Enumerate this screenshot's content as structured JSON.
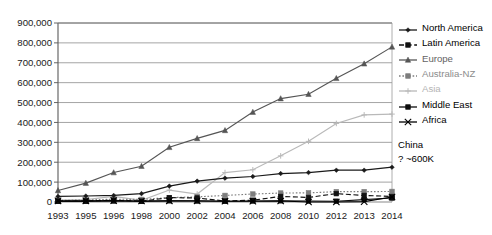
{
  "chart_data": {
    "type": "line",
    "title": "",
    "xlabel": "",
    "ylabel": "",
    "grid": true,
    "legend_position": "right",
    "ylim": [
      0,
      900000
    ],
    "ytick_labels": [
      "0",
      "100,000",
      "200,000",
      "300,000",
      "400,000",
      "500,000",
      "600,000",
      "700,000",
      "800,000",
      "900,000"
    ],
    "ytick_values": [
      0,
      100000,
      200000,
      300000,
      400000,
      500000,
      600000,
      700000,
      800000,
      900000
    ],
    "categories": [
      "1993",
      "1995",
      "1996",
      "1998",
      "2000",
      "2002",
      "2004",
      "2006",
      "2008",
      "2010",
      "2012",
      "2013",
      "2014"
    ],
    "series": [
      {
        "name": "North America",
        "color": "#1a1a1a",
        "marker": "diamond",
        "dash": "solid",
        "values": [
          28000,
          30000,
          33000,
          42000,
          80000,
          105000,
          120000,
          128000,
          143000,
          148000,
          160000,
          160000,
          175000
        ]
      },
      {
        "name": "Latin America",
        "color": "#111111",
        "marker": "square",
        "dash": "dashed",
        "values": [
          4000,
          5000,
          9000,
          4000,
          22000,
          20000,
          5000,
          9000,
          28000,
          23000,
          42000,
          33000,
          28000
        ]
      },
      {
        "name": "Europe",
        "color": "#555555",
        "marker": "triangle",
        "dash": "solid",
        "values": [
          58000,
          95000,
          148000,
          180000,
          275000,
          320000,
          360000,
          452000,
          520000,
          542000,
          622000,
          695000,
          780000
        ]
      },
      {
        "name": "Australia-NZ",
        "color": "#7d7d7d",
        "marker": "square",
        "dash": "dotted",
        "values": [
          8000,
          10000,
          14000,
          13000,
          22000,
          26000,
          33000,
          40000,
          45000,
          46000,
          52000,
          52000,
          53000
        ]
      },
      {
        "name": "Asia",
        "color": "#b9b9b9",
        "marker": "cross",
        "dash": "solid",
        "values": [
          10000,
          12000,
          28000,
          8000,
          60000,
          40000,
          148000,
          162000,
          232000,
          305000,
          395000,
          438000,
          442000
        ]
      },
      {
        "name": "Middle East",
        "color": "#0d0d0d",
        "marker": "square",
        "dash": "solid",
        "values": [
          3000,
          3500,
          5000,
          3000,
          6000,
          5000,
          4000,
          5000,
          6000,
          5000,
          4000,
          12000,
          20000
        ]
      },
      {
        "name": "Africa",
        "color": "#000000",
        "marker": "x",
        "dash": "solid",
        "values": [
          6000,
          6000,
          7000,
          5000,
          6000,
          6000,
          4000,
          4000,
          5000,
          0,
          0,
          2000,
          25000
        ]
      }
    ],
    "annotations": [
      {
        "line1": "China",
        "line2": "? ~600K"
      }
    ]
  },
  "legend": {
    "items": [
      {
        "label": "North America"
      },
      {
        "label": "Latin America"
      },
      {
        "label": "Europe"
      },
      {
        "label": "Australia-NZ"
      },
      {
        "label": "Asia"
      },
      {
        "label": "Middle East"
      },
      {
        "label": "Africa"
      }
    ]
  },
  "note": {
    "line1": "China",
    "line2": "? ~600K"
  }
}
